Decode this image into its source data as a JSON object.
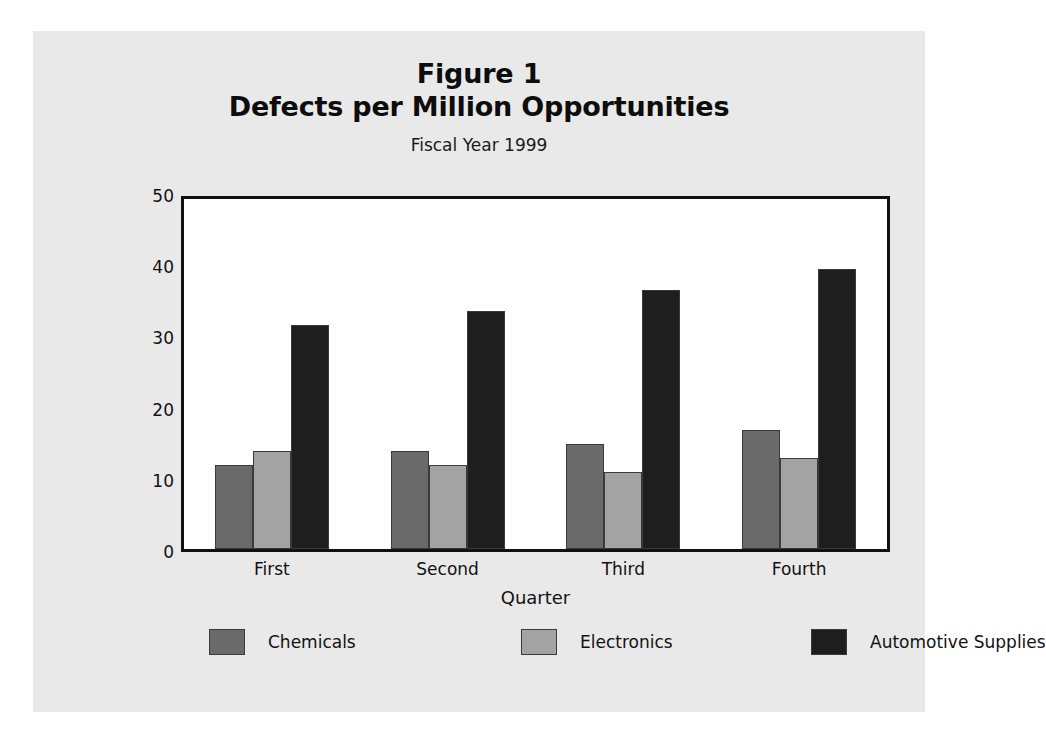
{
  "figure": {
    "title_line1": "Figure 1",
    "title_line2": "Defects per Million Opportunities",
    "subtitle": "Fiscal Year 1999",
    "panel_background": "#e9e9e9",
    "plot_background": "#ffffff",
    "frame_color": "#111111"
  },
  "chart_data": {
    "type": "bar",
    "title": "Defects per Million Opportunities",
    "subtitle": "Fiscal Year 1999",
    "xlabel": "Quarter",
    "ylabel": "Number of Defects",
    "categories": [
      "First",
      "Second",
      "Third",
      "Fourth"
    ],
    "series": [
      {
        "name": "Chemicals",
        "color": "#6a6a6a",
        "values": [
          12,
          14,
          15,
          17
        ]
      },
      {
        "name": "Electronics",
        "color": "#a3a3a3",
        "values": [
          14,
          12,
          11,
          13
        ]
      },
      {
        "name": "Automotive Supplies",
        "color": "#1e1e1e",
        "values": [
          32,
          34,
          37,
          40
        ]
      }
    ],
    "ylim": [
      0,
      50
    ],
    "yticks": [
      0,
      10,
      20,
      30,
      40,
      50
    ],
    "ytick_labels": [
      "0",
      "10",
      "20",
      "30",
      "40",
      "50"
    ],
    "grid": false,
    "legend_position": "bottom"
  }
}
